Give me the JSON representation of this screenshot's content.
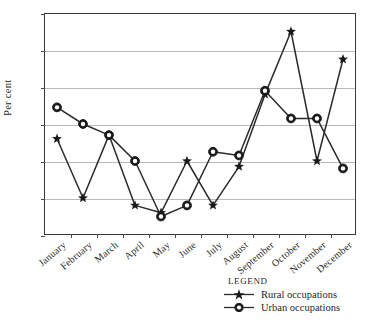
{
  "chart_data": {
    "type": "line",
    "title": "",
    "xlabel": "",
    "ylabel": "Per cent",
    "ylim": [
      6,
      12
    ],
    "yticks": [
      6,
      7,
      8,
      9,
      10,
      11,
      12
    ],
    "grid": true,
    "legend_position": "below-right",
    "legend_title": "Legend",
    "categories": [
      "January",
      "February",
      "March",
      "April",
      "May",
      "June",
      "July",
      "August",
      "September",
      "October",
      "November",
      "December"
    ],
    "series": [
      {
        "name": "Rural occupations",
        "marker": "star",
        "values": [
          8.6,
          7.0,
          8.7,
          6.8,
          6.6,
          8.0,
          6.8,
          7.85,
          9.8,
          11.5,
          8.0,
          10.75
        ]
      },
      {
        "name": "Urban occupations",
        "marker": "circle",
        "values": [
          9.45,
          9.0,
          8.7,
          8.0,
          6.5,
          6.8,
          8.25,
          8.15,
          9.9,
          9.15,
          9.15,
          7.8
        ]
      }
    ]
  },
  "colors": {
    "line": "#2b2b2b",
    "grid": "#b9b9b9",
    "frame": "#3a3a3a",
    "text": "#262626",
    "marker_fill": "#1a1a1a"
  }
}
